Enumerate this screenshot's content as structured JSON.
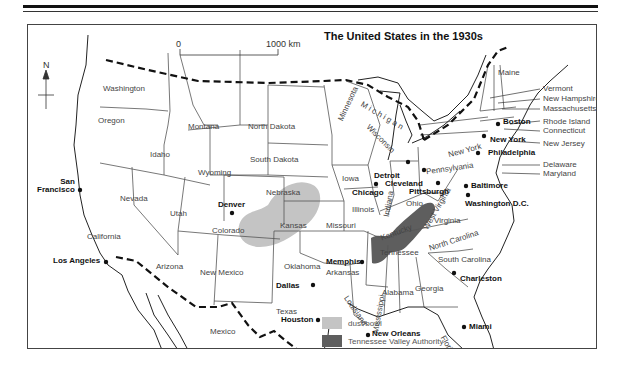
{
  "title": "The United States in the 1930s",
  "scale": {
    "start": "0",
    "end": "1000  km"
  },
  "compass": {
    "label": "N"
  },
  "colors": {
    "dust_bowl": "#c4c4c4",
    "tva": "#5e5e5e",
    "border": "#111111",
    "state_line": "#555555"
  },
  "states": {
    "washington": "Washington",
    "oregon": "Oregon",
    "california": "California",
    "idaho": "Idaho",
    "nevada": "Nevada",
    "montana": "Montana",
    "wyoming": "Wyoming",
    "utah": "Utah",
    "arizona": "Arizona",
    "colorado": "Colorado",
    "new_mexico": "New Mexico",
    "north_dakota": "North Dakota",
    "south_dakota": "South Dakota",
    "nebraska": "Nebraska",
    "kansas": "Kansas",
    "oklahoma": "Oklahoma",
    "texas": "Texas",
    "minnesota": "Minnesota",
    "iowa": "Iowa",
    "missouri": "Missouri",
    "arkansas": "Arkansas",
    "louisiana": "Louisiana",
    "wisconsin": "Wisconsin",
    "illinois": "Illinois",
    "michigan": "M i c h i g a n",
    "indiana": "Indiana",
    "ohio": "Ohio",
    "kentucky": "Kentucky",
    "tennessee": "Tennessee",
    "mississippi": "Mississippi",
    "alabama": "Alabama",
    "georgia": "Georgia",
    "florida": "Florida",
    "south_carolina": "South Carolina",
    "north_carolina": "North Carolina",
    "virginia": "Virginia",
    "west_virginia": "West Virginia",
    "pennsylvania": "Pennsylvania",
    "new_york": "New York",
    "maine": "Maine",
    "mexico": "Mexico"
  },
  "callouts": [
    "Vermont",
    "New Hampshire",
    "Massachusetts",
    "Rhode Island",
    "Connecticut",
    "New Jersey",
    "Delaware",
    "Maryland"
  ],
  "cities": {
    "san_francisco": "San\nFrancisco",
    "los_angeles": "Los Angeles",
    "denver": "Denver",
    "dallas": "Dallas",
    "houston": "Houston",
    "memphis": "Memphis",
    "new_orleans": "New Orleans",
    "chicago": "Chicago",
    "detroit": "Detroit",
    "cleveland": "Cleveland",
    "pittsburgh": "Pittsburgh",
    "philadelphia": "Philadelphia",
    "new_york": "New York",
    "boston": "Boston",
    "baltimore": "Baltimore",
    "washington_dc": "Washington D.C.",
    "charleston": "Charleston",
    "miami": "Miami"
  },
  "legend": [
    {
      "label": "dust bowl",
      "color": "#c4c4c4"
    },
    {
      "label": "Tennessee Valley Authority",
      "color": "#5e5e5e"
    }
  ]
}
